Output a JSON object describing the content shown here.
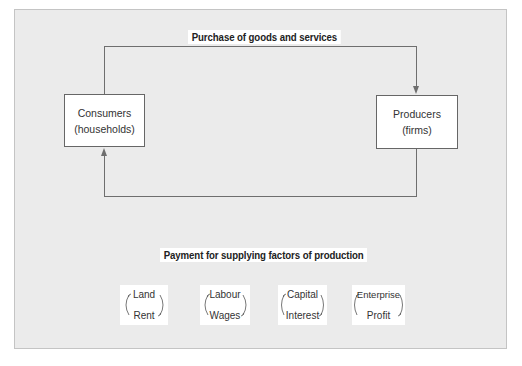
{
  "diagram": {
    "top_flow_label": "Purchase of goods and services",
    "bottom_flow_label": "Payment for supplying factors of production",
    "nodes": [
      {
        "id": "consumers",
        "line1": "Consumers",
        "line2": "(households)"
      },
      {
        "id": "producers",
        "line1": "Producers",
        "line2": "(firms)"
      }
    ],
    "factors": [
      {
        "factor": "Land",
        "reward": "Rent"
      },
      {
        "factor": "Labour",
        "reward": "Wages"
      },
      {
        "factor": "Capital",
        "reward": "Interest"
      },
      {
        "factor": "Enterprise",
        "reward": "Profit"
      }
    ],
    "colors": {
      "panel_bg": "#ebebeb",
      "line": "#6e6e6e",
      "box_bg": "#ffffff"
    }
  }
}
